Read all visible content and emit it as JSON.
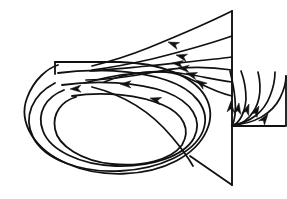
{
  "figure": {
    "caption": "",
    "background_color": "#ffffff",
    "line_color": "#111111"
  },
  "chart_data": {
    "type": "line",
    "subtitle": "",
    "xlabel": "",
    "ylabel": "",
    "xlim": [
      0,
      287
    ],
    "ylim": [
      0,
      199
    ],
    "grid": false,
    "legend": "none",
    "annotations": [],
    "tick_labels": [],
    "surface": {
      "name": "vertical-surface-trace",
      "apex": [
        232,
        11
      ],
      "base": [
        232,
        185
      ],
      "stroke_width": 1.9
    },
    "series": [
      {
        "name": "upper-streamline-1",
        "kind": "attached-streamline",
        "stroke_width": 1.7,
        "path": "M 232 11 C 210 22, 175 37, 148 48 C 128 56, 108 62, 92 66",
        "arrow": {
          "at": [
            168,
            42
          ],
          "angle_deg": 201
        }
      },
      {
        "name": "upper-streamline-2",
        "kind": "attached-streamline",
        "stroke_width": 1.7,
        "path": "M 232 36 C 212 43, 180 52, 152 59 C 130 64, 108 68, 92 70",
        "arrow": {
          "at": [
            176,
            55
          ],
          "angle_deg": 194
        }
      },
      {
        "name": "upper-streamline-3",
        "kind": "attached-streamline",
        "stroke_width": 1.7,
        "path": "M 232 57 C 210 60, 175 63, 148 66 C 126 68, 106 70, 90 71",
        "arrow": {
          "at": [
            172,
            63
          ],
          "angle_deg": 186
        }
      },
      {
        "name": "curving-streamline-4",
        "kind": "rolling-streamline",
        "stroke_width": 1.7,
        "path": "M 232 70 C 206 66, 180 67, 160 71 C 134 76, 108 80, 86 80",
        "arrow": {
          "at": [
            178,
            68
          ],
          "angle_deg": 184
        }
      },
      {
        "name": "curving-streamline-5",
        "kind": "rolling-streamline",
        "stroke_width": 1.7,
        "path": "M 232 82 C 210 79, 188 73, 168 72 C 140 71, 110 76, 84 83",
        "arrow": {
          "at": [
            186,
            73
          ],
          "angle_deg": 196
        }
      },
      {
        "name": "curving-streamline-6",
        "kind": "rolling-streamline",
        "stroke_width": 1.7,
        "path": "M 232 96 C 214 92, 200 83, 186 77 C 164 68, 132 71, 104 82",
        "arrow": {
          "at": [
            196,
            80
          ],
          "angle_deg": 214
        }
      },
      {
        "name": "vortex-spiral-turn-1",
        "kind": "spiral",
        "stroke_width": 1.8,
        "path": "M 55 62 L 120 62 C 160 63, 193 76, 205 96 C 218 118, 206 145, 176 161 C 146 177, 100 178, 68 164 C 34 150, 18 122, 27 98 C 34 79, 48 68, 58 65",
        "arrow": {
          "at": [
            70,
            89
          ],
          "angle_deg": 178
        }
      },
      {
        "name": "vortex-spiral-turn-2",
        "kind": "spiral",
        "stroke_width": 1.8,
        "path": "M 58 73 C 92 68, 136 70, 166 80 C 196 90, 211 110, 203 131 C 194 153, 160 169, 120 171 C 80 173, 44 159, 33 137 C 23 117, 32 95, 55 83",
        "arrow": {
          "at": [
            120,
            84
          ],
          "angle_deg": 182
        }
      },
      {
        "name": "vortex-spiral-turn-3",
        "kind": "spiral",
        "stroke_width": 1.8,
        "path": "M 62 85 C 96 80, 138 82, 166 92 C 192 102, 203 120, 194 138 C 184 156, 152 167, 116 166 C 80 165, 50 150, 43 131 C 36 113, 46 97, 64 90",
        "arrow": {
          "at": [
            150,
            98
          ],
          "angle_deg": 196
        }
      },
      {
        "name": "vortex-spiral-turn-4",
        "kind": "spiral",
        "stroke_width": 1.8,
        "path": "M 72 96 C 104 91, 140 95, 163 105 C 184 114, 191 130, 182 145 C 171 160, 142 167, 112 164 C 82 161, 58 146, 55 129 C 52 113, 62 101, 76 97"
      },
      {
        "name": "inner-core-curve",
        "kind": "core-line",
        "stroke_width": 1.8,
        "path": "M 92 87 C 124 95, 152 113, 172 137 C 182 149, 189 159, 193 166"
      },
      {
        "name": "right-fan-streamline-1",
        "kind": "outboard-streamline",
        "stroke_width": 1.7,
        "path": "M 232 125 C 254 124, 272 114, 280 98 C 284 90, 286 82, 286 76",
        "arrow": {
          "at": [
            268,
            114
          ],
          "angle_deg": 306
        }
      },
      {
        "name": "right-fan-streamline-2",
        "kind": "outboard-streamline",
        "stroke_width": 1.7,
        "path": "M 232 125 C 250 123, 264 112, 270 96 C 274 86, 275 78, 275 72",
        "arrow": {
          "at": [
            259,
            106
          ],
          "angle_deg": 298
        }
      },
      {
        "name": "right-fan-streamline-3",
        "kind": "outboard-streamline",
        "stroke_width": 1.7,
        "path": "M 232 126 C 246 124, 256 112, 259 98 C 261 88, 260 80, 258 72",
        "arrow": {
          "at": [
            249,
            104
          ],
          "angle_deg": 290
        }
      },
      {
        "name": "right-fan-streamline-4",
        "kind": "outboard-streamline",
        "stroke_width": 1.7,
        "path": "M 232 126 C 240 123, 245 112, 246 99 C 246 88, 244 79, 241 71",
        "arrow": {
          "at": [
            239,
            103
          ],
          "angle_deg": 279
        }
      },
      {
        "name": "right-fan-streamline-5",
        "kind": "outboard-streamline",
        "stroke_width": 1.7,
        "path": "M 232 126 C 235 120, 236 110, 235 99 C 234 88, 232 79, 230 71",
        "arrow": {
          "at": [
            231,
            101
          ],
          "angle_deg": 272
        }
      },
      {
        "name": "outboard-base-line",
        "kind": "boundary",
        "stroke_width": 1.8,
        "path": "M 232 126 L 285 126"
      },
      {
        "name": "outboard-outer-edge",
        "kind": "boundary",
        "stroke_width": 1.8,
        "path": "M 286 76 L 286 126"
      },
      {
        "name": "lower-wedge-edge",
        "kind": "boundary",
        "stroke_width": 1.8,
        "path": "M 190 156 L 232 185"
      },
      {
        "name": "spiral-entry-tick",
        "kind": "boundary",
        "stroke_width": 1.8,
        "path": "M 55 62 L 55 74"
      }
    ]
  }
}
